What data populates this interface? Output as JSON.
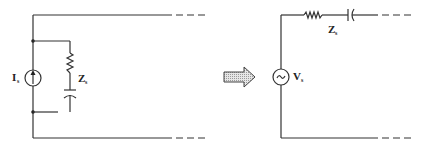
{
  "diagram": {
    "left_circuit": {
      "source_type": "current-source",
      "source_label": "I",
      "source_subscript": "s",
      "impedance_label": "Z",
      "impedance_subscript": "s",
      "impedance_connection": "parallel",
      "impedance_elements": [
        "resistor",
        "capacitor"
      ]
    },
    "transform_arrow": "right-arrow",
    "right_circuit": {
      "source_type": "ac-voltage-source",
      "source_label": "V",
      "source_subscript": "s",
      "impedance_label": "Z",
      "impedance_subscript": "s",
      "impedance_connection": "series",
      "impedance_elements": [
        "resistor",
        "capacitor"
      ]
    },
    "colors": {
      "wire": "#333333",
      "arrow_fill": "#d8d8d8"
    }
  }
}
